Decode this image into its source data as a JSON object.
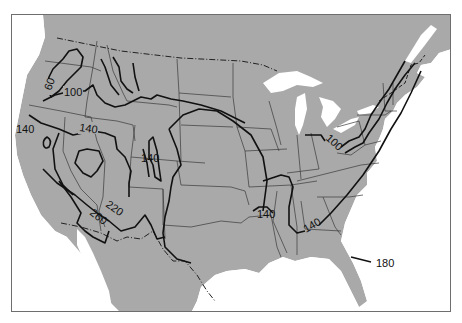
{
  "map": {
    "type": "isoline map",
    "region": "Contiguous United States with southern Canada and northern Mexico",
    "colors": {
      "land": "#a9a9a9",
      "water": "#ffffff",
      "state_borders": "#3a3a3a",
      "contours": "#111111",
      "frame": "#6e6e6e"
    },
    "contour_labels": [
      {
        "id": "c60",
        "text": "60",
        "x": 50,
        "y": 86,
        "rotate": -70
      },
      {
        "id": "c100w",
        "text": "100",
        "x": 63,
        "y": 95,
        "rotate": 0
      },
      {
        "id": "c140nw",
        "text": "140",
        "x": 14,
        "y": 132,
        "rotate": 0
      },
      {
        "id": "c140mid",
        "text": "140",
        "x": 78,
        "y": 130,
        "rotate": 8
      },
      {
        "id": "c140rockies",
        "text": "140",
        "x": 140,
        "y": 161,
        "rotate": 0
      },
      {
        "id": "c220",
        "text": "220",
        "x": 105,
        "y": 212,
        "rotate": 35
      },
      {
        "id": "c260",
        "text": "260",
        "x": 88,
        "y": 218,
        "rotate": 38
      },
      {
        "id": "c100e",
        "text": "100",
        "x": 326,
        "y": 144,
        "rotate": 42
      },
      {
        "id": "c140ark",
        "text": "140",
        "x": 256,
        "y": 217,
        "rotate": 0
      },
      {
        "id": "c140se",
        "text": "140",
        "x": 306,
        "y": 228,
        "rotate": -30
      },
      {
        "id": "c180",
        "text": "180",
        "x": 376,
        "y": 265,
        "rotate": 0
      }
    ]
  }
}
